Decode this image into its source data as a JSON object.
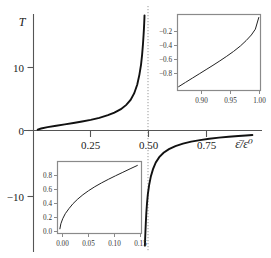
{
  "chart_data": {
    "type": "line",
    "title": "",
    "xlabel": "ε̄/ε⁰",
    "ylabel": "T",
    "xlim": [
      -0.02,
      1.04
    ],
    "ylim": [
      -17.5,
      17.5
    ],
    "grid": false,
    "legend": null,
    "annotations": [
      {
        "name": "vertical-asymptote",
        "x": 0.5,
        "style": "dotted",
        "label": ""
      }
    ],
    "x_ticks": [
      {
        "value": 0.25,
        "label": "0.25"
      },
      {
        "value": 0.5,
        "label": "0.50"
      },
      {
        "value": 0.75,
        "label": "0.75"
      }
    ],
    "y_ticks": [
      {
        "value": 10,
        "label": "10"
      },
      {
        "value": 0,
        "label": "0"
      },
      {
        "value": -10,
        "label": "−10"
      }
    ],
    "series": [
      {
        "name": "T-left-branch",
        "comment": "rises from 0 at x=0 to +infinity as x approaches 0.50 from below",
        "x": [
          0.004,
          0.02,
          0.05,
          0.09,
          0.13,
          0.17,
          0.21,
          0.25,
          0.29,
          0.33,
          0.36,
          0.39,
          0.415,
          0.435,
          0.452,
          0.466,
          0.476,
          0.4835,
          0.4885,
          0.4925,
          0.4952,
          0.497,
          0.4982,
          0.4991,
          0.4996
        ],
        "y": [
          0.13,
          0.3,
          0.5,
          0.72,
          0.92,
          1.12,
          1.35,
          1.6,
          1.9,
          2.3,
          2.7,
          3.2,
          3.85,
          4.6,
          5.6,
          6.9,
          8.4,
          9.9,
          11.4,
          13.0,
          14.3,
          15.3,
          16.1,
          16.8,
          17.3
        ]
      },
      {
        "name": "T-right-branch",
        "comment": "rises from -infinity just right of x=0.50 toward 0 as x approaches 1",
        "x": [
          0.5014,
          0.5025,
          0.504,
          0.5058,
          0.508,
          0.511,
          0.515,
          0.521,
          0.529,
          0.539,
          0.552,
          0.568,
          0.588,
          0.613,
          0.643,
          0.678,
          0.716,
          0.757,
          0.8,
          0.845,
          0.89,
          0.935,
          0.97,
          1.0
        ],
        "y": [
          -17.3,
          -16.3,
          -15.1,
          -13.8,
          -12.4,
          -11.0,
          -9.6,
          -8.2,
          -6.9,
          -5.8,
          -4.8,
          -4.0,
          -3.35,
          -2.8,
          -2.35,
          -1.98,
          -1.68,
          -1.44,
          -1.24,
          -1.07,
          -0.93,
          -0.82,
          -0.74,
          -0.68
        ]
      }
    ],
    "insets": [
      {
        "name": "inset-top-right",
        "position": "top-right",
        "type": "line",
        "xlim": [
          0.858,
          1.003
        ],
        "ylim": [
          -0.95,
          -0.06
        ],
        "x_ticks": [
          {
            "value": 0.9,
            "label": "0.90"
          },
          {
            "value": 0.95,
            "label": "0.95"
          },
          {
            "value": 1.0,
            "label": "1.00"
          }
        ],
        "y_ticks": [
          {
            "value": -0.2,
            "label": "−0.2"
          },
          {
            "value": -0.4,
            "label": "−0.4"
          },
          {
            "value": -0.6,
            "label": "−0.6"
          },
          {
            "value": -0.8,
            "label": "−0.8"
          }
        ],
        "series": [
          {
            "name": "T-zoom-right",
            "x": [
              0.86,
              0.872,
              0.884,
              0.896,
              0.908,
              0.92,
              0.932,
              0.944,
              0.956,
              0.968,
              0.978,
              0.987,
              0.994,
              1.0
            ],
            "y": [
              -0.905,
              -0.855,
              -0.805,
              -0.755,
              -0.705,
              -0.655,
              -0.603,
              -0.549,
              -0.492,
              -0.428,
              -0.365,
              -0.3,
              -0.232,
              -0.095
            ]
          }
        ]
      },
      {
        "name": "inset-bottom-left",
        "position": "bottom-left",
        "type": "line",
        "xlim": [
          -0.004,
          0.158
        ],
        "ylim": [
          -0.03,
          0.97
        ],
        "x_ticks": [
          {
            "value": 0.0,
            "label": "0.00"
          },
          {
            "value": 0.05,
            "label": "0.05"
          },
          {
            "value": 0.1,
            "label": "0.10"
          },
          {
            "value": 0.15,
            "label": "0.15"
          }
        ],
        "y_ticks": [
          {
            "value": 0.0,
            "label": "0.0"
          },
          {
            "value": 0.2,
            "label": "0.2"
          },
          {
            "value": 0.4,
            "label": "0.4"
          },
          {
            "value": 0.6,
            "label": "0.6"
          },
          {
            "value": 0.8,
            "label": "0.8"
          }
        ],
        "series": [
          {
            "name": "T-zoom-left",
            "x": [
              0.0006,
              0.0025,
              0.006,
              0.011,
              0.018,
              0.026,
              0.035,
              0.045,
              0.056,
              0.068,
              0.081,
              0.094,
              0.108,
              0.122,
              0.136,
              0.15
            ],
            "y": [
              0.035,
              0.105,
              0.175,
              0.245,
              0.315,
              0.385,
              0.448,
              0.508,
              0.565,
              0.62,
              0.673,
              0.722,
              0.772,
              0.82,
              0.868,
              0.915
            ]
          }
        ]
      }
    ]
  }
}
